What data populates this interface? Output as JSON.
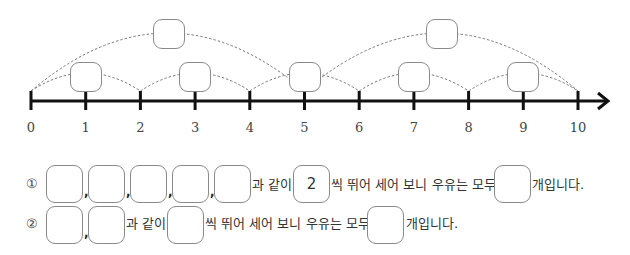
{
  "number_line": {
    "ticks": [
      "0",
      "1",
      "2",
      "3",
      "4",
      "5",
      "6",
      "7",
      "8",
      "9",
      "10"
    ],
    "min": 0,
    "max": 10,
    "small_jumps": [
      [
        0,
        2
      ],
      [
        2,
        4
      ],
      [
        4,
        6
      ],
      [
        6,
        8
      ],
      [
        8,
        10
      ]
    ],
    "large_jumps": [
      [
        0,
        5
      ],
      [
        5,
        10
      ]
    ],
    "small_jump_boxes": [
      "",
      "",
      "",
      "",
      ""
    ],
    "large_jump_boxes": [
      "",
      ""
    ]
  },
  "question1": {
    "marker": "①",
    "blanks": [
      "",
      "",
      "",
      "",
      ""
    ],
    "separator": ",",
    "text_like": "과 같이",
    "step_value": "2",
    "text_middle": "씩 뛰어 세어 보니 우유는 모두",
    "total_blank": "",
    "text_end": "개입니다."
  },
  "question2": {
    "marker": "②",
    "blanks": [
      "",
      ""
    ],
    "separator": ",",
    "text_like": "과 같이",
    "step_blank": "",
    "text_middle": "씩 뛰어 세어 보니 우유는 모두",
    "total_blank": "",
    "text_end": "개입니다."
  }
}
